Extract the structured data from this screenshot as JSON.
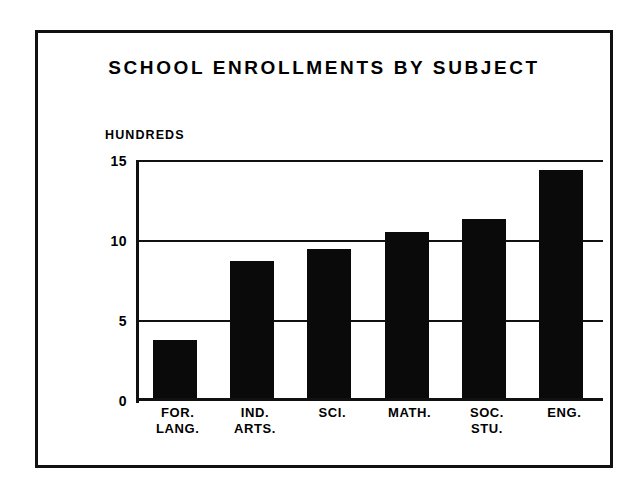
{
  "chart_data": {
    "type": "bar",
    "title": "SCHOOL ENROLLMENTS BY SUBJECT",
    "xlabel": "",
    "ylabel": "HUNDREDS",
    "categories": [
      "FOR.\nLANG.",
      "IND.\nARTS.",
      "SCI.",
      "MATH.",
      "SOC.\nSTU.",
      "ENG."
    ],
    "values": [
      3.7,
      8.7,
      9.4,
      10.5,
      11.3,
      14.4
    ],
    "ylim": [
      0,
      15
    ],
    "yticks": [
      0,
      5,
      10,
      15
    ],
    "ytick_labels": [
      "0",
      "5",
      "10",
      "15"
    ],
    "grid": true,
    "legend": "none",
    "bar_color": "#0a0a0a",
    "background_color": "#ffffff",
    "axis_color": "#111111"
  },
  "figure": {
    "border_color": "#111111"
  }
}
